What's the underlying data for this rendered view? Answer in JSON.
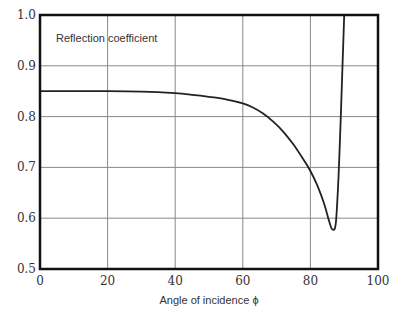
{
  "chart_data": {
    "type": "line",
    "title": "",
    "xlabel": "Angle of  incidence ϕ",
    "ylabel": "",
    "annotation": "Reflection coefficient",
    "xlim": [
      0,
      100
    ],
    "ylim": [
      0.5,
      1.0
    ],
    "xticks": [
      0,
      20,
      40,
      60,
      80,
      100
    ],
    "xtick_labels": [
      "0",
      "20",
      "40",
      "60",
      "80",
      "100"
    ],
    "yticks": [
      0.5,
      0.6,
      0.7,
      0.8,
      0.9,
      1.0
    ],
    "ytick_labels": [
      "0.5",
      "0.6",
      "0.7",
      "0.8",
      "0.9",
      "1.0"
    ],
    "grid": true,
    "legend": "none",
    "series": [
      {
        "name": "Reflection coefficient",
        "color": "#222222",
        "x": [
          0,
          10,
          20,
          30,
          40,
          45,
          50,
          55,
          60,
          63,
          66,
          69,
          72,
          75,
          78,
          80,
          82,
          84,
          85.5,
          86.5,
          87.5,
          88.3,
          89,
          89.5,
          90
        ],
        "y": [
          0.85,
          0.85,
          0.85,
          0.849,
          0.846,
          0.843,
          0.839,
          0.834,
          0.826,
          0.818,
          0.806,
          0.79,
          0.77,
          0.745,
          0.715,
          0.693,
          0.665,
          0.63,
          0.595,
          0.578,
          0.59,
          0.68,
          0.8,
          0.9,
          1.0
        ]
      }
    ]
  }
}
